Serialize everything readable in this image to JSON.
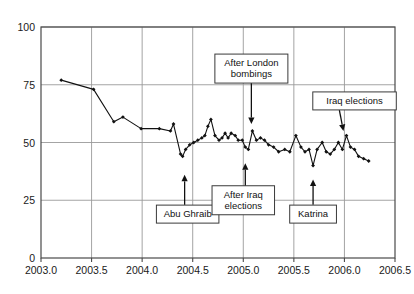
{
  "chart_data": {
    "type": "line",
    "title": "",
    "subtitle": "",
    "xlabel": "",
    "ylabel": "",
    "xlim": [
      2003.0,
      2006.5
    ],
    "ylim": [
      0,
      100
    ],
    "grid": true,
    "legend_position": "none",
    "x_ticks": [
      "2003.0",
      "2003.5",
      "2004.0",
      "2004.5",
      "2005.0",
      "2005.5",
      "2006.0",
      "2006.5"
    ],
    "x_tick_values": [
      2003.0,
      2003.5,
      2004.0,
      2004.5,
      2005.0,
      2005.5,
      2006.0,
      2006.5
    ],
    "y_ticks": [
      "0",
      "25",
      "50",
      "75",
      "100"
    ],
    "y_tick_values": [
      0,
      25,
      50,
      75,
      100
    ],
    "series": [
      {
        "name": "approval",
        "marker": "diamond",
        "color": "#111111",
        "x": [
          2003.2,
          2003.52,
          2003.72,
          2003.81,
          2003.99,
          2004.17,
          2004.28,
          2004.31,
          2004.38,
          2004.4,
          2004.43,
          2004.47,
          2004.51,
          2004.55,
          2004.59,
          2004.62,
          2004.65,
          2004.68,
          2004.72,
          2004.76,
          2004.79,
          2004.82,
          2004.85,
          2004.88,
          2004.92,
          2004.95,
          2004.99,
          2005.02,
          2005.05,
          2005.09,
          2005.13,
          2005.17,
          2005.21,
          2005.25,
          2005.3,
          2005.35,
          2005.41,
          2005.46,
          2005.52,
          2005.57,
          2005.61,
          2005.65,
          2005.69,
          2005.73,
          2005.78,
          2005.82,
          2005.86,
          2005.9,
          2005.94,
          2005.98,
          2006.02,
          2006.06,
          2006.1,
          2006.14,
          2006.19,
          2006.24
        ],
        "y": [
          77,
          73,
          59,
          61,
          56,
          56,
          55,
          58,
          45,
          44,
          47,
          49,
          50,
          51,
          52,
          53,
          57,
          60,
          53,
          51,
          52,
          54,
          52,
          54,
          53,
          51,
          51,
          48,
          47,
          55,
          51,
          52,
          51,
          49,
          48,
          46,
          47,
          46,
          53,
          48,
          46,
          47,
          40,
          47,
          50,
          46,
          45,
          47,
          50,
          47,
          53,
          48,
          47,
          44,
          43,
          42
        ]
      }
    ],
    "annotations": [
      {
        "id": "after-london-bombings",
        "label": "After London\nbombings",
        "label_lines": [
          "After London",
          "bombings"
        ],
        "box_x": 2005.08,
        "box_y": 82,
        "arrow_from_x": 2005.08,
        "arrow_from_y": 76,
        "arrow_to_x": 2005.08,
        "arrow_to_y": 58,
        "arrow_direction": "down"
      },
      {
        "id": "iraq-elections",
        "label": "Iraq elections",
        "label_lines": [
          "Iraq elections"
        ],
        "box_x": 2006.1,
        "box_y": 68,
        "arrow_from_x": 2005.95,
        "arrow_from_y": 64,
        "arrow_to_x": 2005.99,
        "arrow_to_y": 55,
        "arrow_direction": "diagonal"
      },
      {
        "id": "abu-ghraib",
        "label": "Abu Ghraib",
        "label_lines": [
          "Abu Ghraib"
        ],
        "box_x": 2004.45,
        "box_y": 19,
        "arrow_from_x": 2004.42,
        "arrow_from_y": 23,
        "arrow_to_x": 2004.42,
        "arrow_to_y": 36,
        "arrow_direction": "up"
      },
      {
        "id": "after-iraq-elections",
        "label": "After Iraq\nelections",
        "label_lines": [
          "After Iraq",
          "elections"
        ],
        "box_x": 2005.0,
        "box_y": 25,
        "arrow_from_x": 2005.02,
        "arrow_from_y": 31,
        "arrow_to_x": 2005.02,
        "arrow_to_y": 41
      },
      {
        "id": "katrina",
        "label": "Katrina",
        "label_lines": [
          "Katrina"
        ],
        "box_x": 2005.69,
        "box_y": 19,
        "arrow_from_x": 2005.69,
        "arrow_from_y": 23,
        "arrow_to_x": 2005.69,
        "arrow_to_y": 34,
        "arrow_direction": "up"
      }
    ]
  }
}
